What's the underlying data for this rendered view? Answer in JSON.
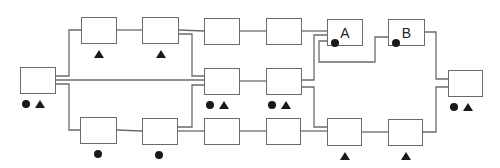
{
  "diagram": {
    "colors": {
      "line": "#6b6b6b",
      "marker": "#1a1a1a",
      "background": "#ffffff"
    },
    "legend_symbols": {
      "circle": "filled circle marker",
      "triangle": "filled triangle marker"
    },
    "nodes": [
      {
        "id": "left",
        "label": "",
        "x": 20,
        "y": 67,
        "w": 36,
        "h": 27,
        "marks": [
          "circle",
          "triangle"
        ]
      },
      {
        "id": "top1",
        "label": "",
        "x": 81,
        "y": 17,
        "w": 36,
        "h": 27,
        "marks": [
          "triangle"
        ]
      },
      {
        "id": "top2",
        "label": "",
        "x": 142,
        "y": 17,
        "w": 37,
        "h": 27,
        "marks": [
          "triangle"
        ]
      },
      {
        "id": "top3",
        "label": "",
        "x": 204,
        "y": 18,
        "w": 36,
        "h": 27,
        "marks": []
      },
      {
        "id": "top4",
        "label": "",
        "x": 266,
        "y": 18,
        "w": 36,
        "h": 27,
        "marks": []
      },
      {
        "id": "A",
        "label": "A",
        "x": 327,
        "y": 19,
        "w": 36,
        "h": 27,
        "marks": [
          "circle"
        ]
      },
      {
        "id": "B",
        "label": "B",
        "x": 388,
        "y": 19,
        "w": 37,
        "h": 27,
        "marks": [
          "circle"
        ]
      },
      {
        "id": "mid1",
        "label": "",
        "x": 204,
        "y": 68,
        "w": 36,
        "h": 27,
        "marks": [
          "circle",
          "triangle"
        ]
      },
      {
        "id": "mid2",
        "label": "",
        "x": 266,
        "y": 68,
        "w": 36,
        "h": 27,
        "marks": [
          "circle",
          "triangle"
        ]
      },
      {
        "id": "bot1",
        "label": "",
        "x": 80,
        "y": 117,
        "w": 37,
        "h": 27,
        "marks": [
          "circle"
        ]
      },
      {
        "id": "bot2",
        "label": "",
        "x": 142,
        "y": 118,
        "w": 36,
        "h": 27,
        "marks": [
          "circle"
        ]
      },
      {
        "id": "bot3",
        "label": "",
        "x": 204,
        "y": 118,
        "w": 36,
        "h": 27,
        "marks": []
      },
      {
        "id": "bot4",
        "label": "",
        "x": 266,
        "y": 118,
        "w": 35,
        "h": 27,
        "marks": []
      },
      {
        "id": "bot5",
        "label": "",
        "x": 327,
        "y": 118,
        "w": 35,
        "h": 28,
        "marks": [
          "triangle"
        ]
      },
      {
        "id": "bot6",
        "label": "",
        "x": 388,
        "y": 119,
        "w": 35,
        "h": 27,
        "marks": [
          "triangle"
        ]
      },
      {
        "id": "right",
        "label": "",
        "x": 448,
        "y": 70,
        "w": 35,
        "h": 27,
        "marks": [
          "circle",
          "triangle"
        ]
      }
    ],
    "wires": [
      "M56,76 L69,76 L69,30 L81,30",
      "M56,80 L204,80",
      "M56,84 L69,84 L69,130 L80,130",
      "M117,30 L142,30",
      "M179,30 L204,31",
      "M179,34 L192,34 L192,76 L204,76",
      "M240,31 L266,31",
      "M302,31 L327,31",
      "M117,130 L142,131",
      "M178,127 L192,127 L192,85 L204,85",
      "M178,131 L204,131",
      "M240,131 L266,131",
      "M301,131 L327,131",
      "M240,81 L266,81",
      "M302,80 L314,80 L314,35 L327,35",
      "M302,87 L314,87 L314,127 L327,127",
      "M327,41 L319,41 L319,62 L375,62 L375,37 L388,37",
      "M362,132 L388,132",
      "M425,32 L436,32 L436,79 L448,79",
      "M423,132 L436,132 L436,87 L448,87"
    ]
  }
}
